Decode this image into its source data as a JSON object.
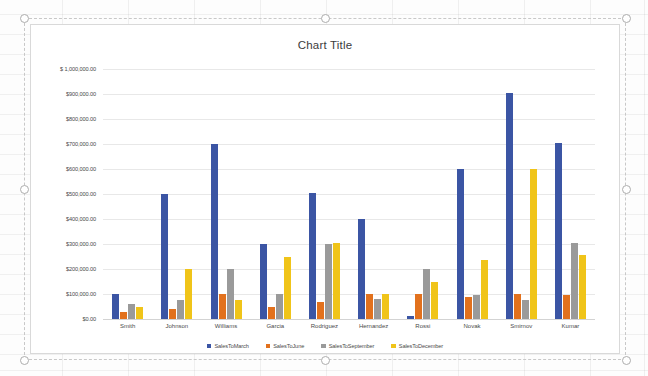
{
  "chart_data": {
    "type": "bar",
    "title": "Chart Title",
    "xlabel": "",
    "ylabel": "",
    "ylim": [
      0,
      1000000
    ],
    "grid": true,
    "legend_position": "bottom",
    "categories": [
      "Smith",
      "Johnson",
      "Williams",
      "Garcia",
      "Rodriguez",
      "Hernandez",
      "Rossi",
      "Novak",
      "Smirnov",
      "Kumar"
    ],
    "ytick_labels": [
      "$ 1,000,000.00",
      "$900,000.00",
      "$800,000.00",
      "$700,000.00",
      "$600,000.00",
      "$500,000.00",
      "$400,000.00",
      "$300,000.00",
      "$200,000.00",
      "$100,000.00",
      "$0.00"
    ],
    "ytick_values": [
      1000000,
      900000,
      800000,
      700000,
      600000,
      500000,
      400000,
      300000,
      200000,
      100000,
      0
    ],
    "series": [
      {
        "name": "SalesToMarch",
        "color": "#3b55a4",
        "values": [
          100000,
          500000,
          700000,
          300000,
          505000,
          400000,
          12000,
          600000,
          905000,
          705000
        ]
      },
      {
        "name": "SalesToJune",
        "color": "#e2711d",
        "values": [
          30000,
          40000,
          100000,
          50000,
          70000,
          100000,
          100000,
          90000,
          100000,
          95000
        ]
      },
      {
        "name": "SalesToSeptember",
        "color": "#9a9a9a",
        "values": [
          60000,
          75000,
          200000,
          100000,
          300000,
          80000,
          200000,
          95000,
          75000,
          305000
        ]
      },
      {
        "name": "SalesToDecember",
        "color": "#f0c419",
        "values": [
          50000,
          200000,
          75000,
          250000,
          305000,
          100000,
          150000,
          235000,
          600000,
          255000
        ]
      }
    ]
  },
  "chart_object": {
    "selected": true,
    "handles": [
      "top-left",
      "top-center",
      "top-right",
      "middle-left",
      "middle-right",
      "bottom-left",
      "bottom-center",
      "bottom-right"
    ]
  }
}
